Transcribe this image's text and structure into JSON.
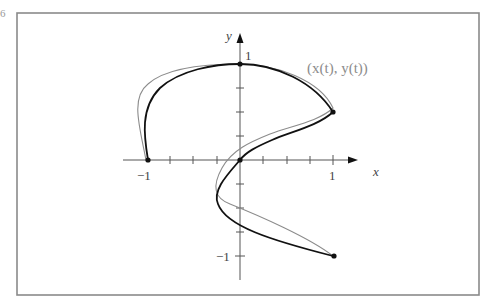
{
  "figure": {
    "corner_mark": "6",
    "axis_labels": {
      "x": "x",
      "y": "y"
    },
    "tick_labels": {
      "x_neg": "−1",
      "x_pos": "1",
      "y_pos": "1",
      "y_neg": "−1"
    },
    "curve_label": "(x(t), y(t))",
    "colors": {
      "frame": "#8a8a8a",
      "black_curve": "#111111",
      "gray_curve": "#8c8c8c",
      "axis": "#555555"
    },
    "axes": {
      "x_range": [
        -1.25,
        1.25
      ],
      "y_range": [
        -1.25,
        1.3
      ],
      "x_tick_step": 0.25,
      "y_tick_step": 0.25
    },
    "points": [
      {
        "x": -1,
        "y": 0
      },
      {
        "x": 0,
        "y": 1
      },
      {
        "x": 1,
        "y": 0.5
      },
      {
        "x": 0,
        "y": 0
      },
      {
        "x": 1,
        "y": -1
      }
    ],
    "curves": [
      {
        "name": "interpolating spline",
        "style": "black"
      },
      {
        "name": "parametric curve (x(t), y(t))",
        "style": "gray"
      }
    ]
  }
}
